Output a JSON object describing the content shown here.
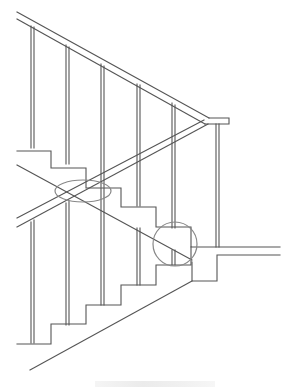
{
  "figure": {
    "type": "technical line drawing",
    "stroke_color": "#555555",
    "highlight_color": "#888888",
    "background": "#ffffff"
  },
  "annotations": {
    "ellipse_mark": {
      "label": "ellipse highlight at stair/handrail intersection",
      "cx": 83,
      "cy": 191,
      "rx": 28,
      "ry": 11
    },
    "circle_mark": {
      "label": "circle highlight at landing junction",
      "cx": 175,
      "cy": 244,
      "r": 22
    }
  },
  "caption": {
    "visible": true,
    "legible": false
  }
}
